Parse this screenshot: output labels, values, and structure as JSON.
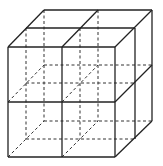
{
  "diagram": {
    "title": "",
    "colors": {
      "line": "#222222",
      "background": "#ffffff"
    },
    "front_face": {
      "x1": 8,
      "y1": 47,
      "x2": 115,
      "y2": 157
    },
    "back_offset": {
      "dx": 36,
      "dy": -37
    },
    "solid_lines": [
      [
        8,
        47,
        115,
        47
      ],
      [
        115,
        47,
        115,
        157
      ],
      [
        115,
        157,
        8,
        157
      ],
      [
        8,
        157,
        8,
        47
      ],
      [
        62,
        47,
        62,
        157
      ],
      [
        8,
        102,
        115,
        102
      ],
      [
        8,
        47,
        44,
        10
      ],
      [
        44,
        10,
        152,
        10
      ],
      [
        152,
        10,
        115,
        47
      ],
      [
        26,
        28,
        135,
        28
      ],
      [
        62,
        47,
        98,
        10
      ],
      [
        152,
        10,
        152,
        121
      ],
      [
        152,
        121,
        115,
        157
      ],
      [
        135,
        28,
        135,
        139
      ],
      [
        115,
        102,
        152,
        65
      ]
    ],
    "dashed_lines": [
      [
        44,
        10,
        44,
        121
      ],
      [
        44,
        121,
        152,
        121
      ],
      [
        98,
        10,
        98,
        121
      ],
      [
        44,
        65,
        152,
        65
      ],
      [
        26,
        28,
        26,
        139
      ],
      [
        26,
        139,
        135,
        139
      ],
      [
        8,
        157,
        44,
        121
      ],
      [
        62,
        157,
        98,
        121
      ],
      [
        8,
        102,
        44,
        65
      ],
      [
        62,
        102,
        98,
        65
      ],
      [
        80,
        28,
        80,
        139
      ],
      [
        26,
        83,
        135,
        83
      ],
      [
        62,
        47,
        62,
        47
      ],
      [
        80,
        28,
        80,
        28
      ],
      [
        26,
        28,
        26,
        28
      ]
    ]
  }
}
